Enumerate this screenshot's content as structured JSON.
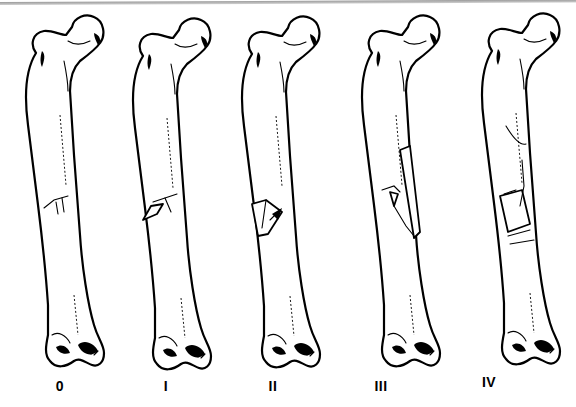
{
  "figure": {
    "type": "femoral shaft fracture comminution classification",
    "panels": [
      {
        "label": "0",
        "description": "simple transverse/short oblique fracture, no comminution",
        "x": 60
      },
      {
        "label": "I",
        "description": "small butterfly fragment",
        "x": 166
      },
      {
        "label": "II",
        "description": "larger butterfly fragment",
        "x": 273
      },
      {
        "label": "III",
        "description": "large fragment spanning most of the shaft width",
        "x": 427
      },
      {
        "label": "IV",
        "description": "segmental comminution, no cortical contact",
        "x": 518
      }
    ]
  },
  "colors": {
    "line": "#000000",
    "background": "#ffffff",
    "top_rule": "#9a9a9a"
  }
}
